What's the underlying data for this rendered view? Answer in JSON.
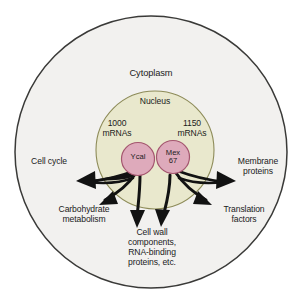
{
  "figure": {
    "type": "biology-diagram",
    "colors": {
      "background": "#ffffff",
      "cytoplasm_fill": "#f2f1ef",
      "cytoplasm_stroke": "#3a3a38",
      "nucleus_fill": "#e9e8cd",
      "nucleus_stroke": "#8d8b58",
      "node_fill": "#deaabb",
      "node_stroke": "#a4566f",
      "arrow": "#121212",
      "text": "#1b1b1b"
    }
  },
  "compartments": {
    "outer": {
      "name": "cytoplasm",
      "label": "Cytoplasm"
    },
    "inner": {
      "name": "nucleus",
      "label": "Nucleus"
    }
  },
  "mrna_counts": [
    {
      "id": "mrna-left",
      "count": "1000",
      "unit": "mRNAs",
      "label": "1000\nmRNAs",
      "associated_node": "Ycal"
    },
    {
      "id": "mrna-right",
      "count": "1150",
      "unit": "mRNAs",
      "label": "1150\nmRNAs",
      "associated_node": "Mex 67"
    }
  ],
  "nodes": [
    {
      "id": "node-yra1",
      "label": "Ycal",
      "shape": "circle"
    },
    {
      "id": "node-mex67",
      "label": "Mex\n67",
      "shape": "circle"
    }
  ],
  "outcomes": [
    {
      "id": "cell-cycle",
      "label": "Cell cycle"
    },
    {
      "id": "carbohydrate-metabolism",
      "label": "Carbohydrate\nmetabolism"
    },
    {
      "id": "cell-wall",
      "label": "Cell wall\ncomponents,\nRNA-binding\nproteins, etc."
    },
    {
      "id": "translation-factors",
      "label": "Translation\nfactors"
    },
    {
      "id": "membrane-proteins",
      "label": "Membrane\nproteins"
    }
  ],
  "arrows": {
    "count": 6,
    "style": "curved-tapered-arrow",
    "direction": "outward-from-nucleus"
  }
}
